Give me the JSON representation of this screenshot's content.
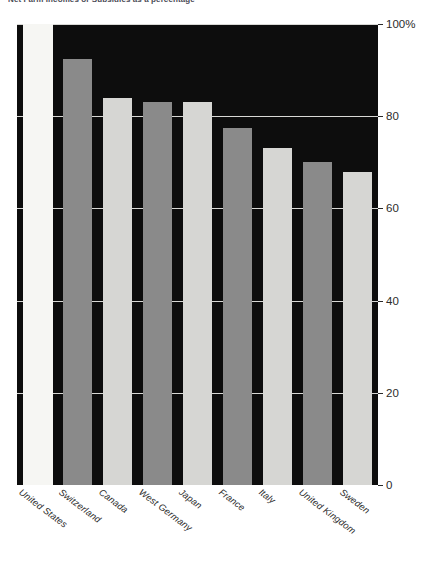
{
  "title_strip": {
    "text": "Net Farm Incomes or Subsidies as a percentage"
  },
  "chart_data": {
    "type": "bar",
    "title": "",
    "subtitle": "",
    "xlabel": "",
    "ylabel": "",
    "categories": [
      "United States",
      "Switzerland",
      "Canada",
      "West Germany",
      "Japan",
      "France",
      "Italy",
      "United Kingdom",
      "Sweden"
    ],
    "values": [
      100,
      92.5,
      84,
      83,
      83,
      77.5,
      73,
      70,
      68
    ],
    "series": [
      {
        "name": "Percentage",
        "values": [
          100,
          92.5,
          84,
          83,
          83,
          77.5,
          73,
          70,
          68
        ]
      }
    ],
    "bar_colors": [
      "#f6f6f3",
      "#8a8a8a",
      "#d6d6d3",
      "#8a8a8a",
      "#d6d6d3",
      "#8a8a8a",
      "#d6d6d3",
      "#8a8a8a",
      "#d6d6d3"
    ],
    "ylim": [
      0,
      100
    ],
    "ytick_values": [
      100,
      80,
      60,
      40,
      20,
      0
    ],
    "ytick_labels": [
      "100%",
      "80",
      "60",
      "40",
      "20",
      "0"
    ],
    "grid": true,
    "grid_color": "#e9e9e6",
    "plot_background": "#0d0d0d",
    "legend": null,
    "legend_position": "none",
    "xtick_rotation": -37
  }
}
